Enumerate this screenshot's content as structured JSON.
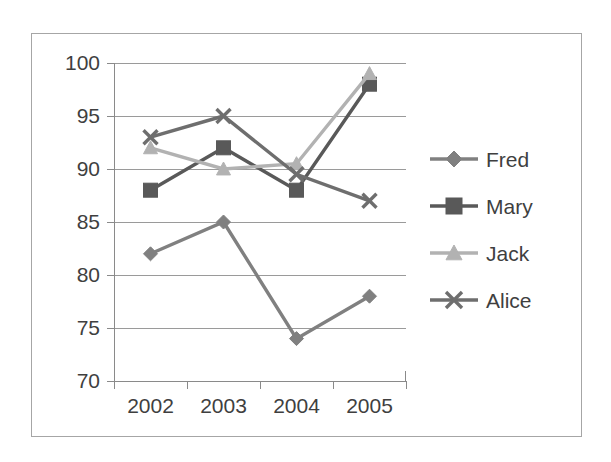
{
  "chart_data": {
    "type": "line",
    "title": "",
    "xlabel": "",
    "ylabel": "",
    "categories": [
      "2002",
      "2003",
      "2004",
      "2005"
    ],
    "ylim": [
      70,
      100
    ],
    "yticks": [
      70,
      75,
      80,
      85,
      90,
      95,
      100
    ],
    "grid": true,
    "legend_position": "right",
    "series": [
      {
        "name": "Fred",
        "marker": "diamond",
        "color": "#808080",
        "values": [
          82,
          85,
          74,
          78
        ]
      },
      {
        "name": "Mary",
        "marker": "square",
        "color": "#595959",
        "values": [
          88,
          92,
          88,
          98
        ]
      },
      {
        "name": "Jack",
        "marker": "triangle",
        "color": "#b2b2b2",
        "values": [
          92,
          90,
          90.5,
          99
        ]
      },
      {
        "name": "Alice",
        "marker": "cross",
        "color": "#6e6e6e",
        "values": [
          93,
          95,
          89.5,
          87
        ]
      }
    ]
  },
  "axes": {
    "y_tick_labels": [
      "100",
      "95",
      "90",
      "85",
      "80",
      "75",
      "70"
    ],
    "x_tick_labels": [
      "2002",
      "2003",
      "2004",
      "2005"
    ]
  },
  "legend": {
    "entries": [
      {
        "label": "Fred"
      },
      {
        "label": "Mary"
      },
      {
        "label": "Jack"
      },
      {
        "label": "Alice"
      }
    ]
  },
  "colors": {
    "frame_border": "#a6a6a6",
    "gridline": "#9a9a9a",
    "axis": "#8a8a8a",
    "text": "#3f3f3f",
    "background": "#ffffff"
  }
}
